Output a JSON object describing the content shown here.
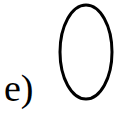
{
  "figure": {
    "label": "e)",
    "shape": {
      "type": "ellipse",
      "stroke": "#000000",
      "fill": "none"
    }
  }
}
